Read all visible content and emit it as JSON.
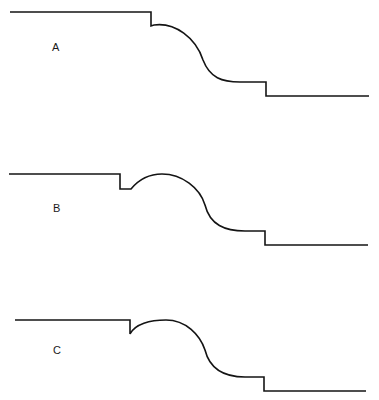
{
  "diagram": {
    "type": "profile-comparison",
    "stroke_color": "#141414",
    "background": "#ffffff",
    "profiles": [
      {
        "label": "A",
        "label_pos": [
          52,
          42
        ],
        "path": "M10,12 L151,12 L151,26 L154,25 C175,22 196,38 203,60 C210,78 222,82 240,82 L266,82 L266,96 L369,96"
      },
      {
        "label": "B",
        "label_pos": [
          53,
          203
        ],
        "path": "M9,174 L120,174 L120,189 L131,189 C140,178 152,174 162,174 C182,174 200,188 205,205 C210,225 225,231 245,231 L265,231 L265,245 L368,245"
      },
      {
        "label": "C",
        "label_pos": [
          53,
          345
        ],
        "path": "M15,320 L130,320 L130,334 C135,324 150,320 166,320 C186,320 200,335 205,350 C210,370 225,377 245,377 L264,377 L264,391 L366,391"
      }
    ]
  }
}
